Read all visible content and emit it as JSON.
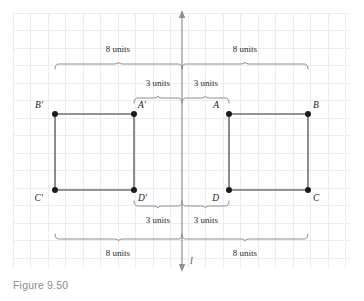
{
  "figure": {
    "caption": "Figure 9.50",
    "line_label": "l",
    "canvas": {
      "width": 364,
      "height": 301
    },
    "grid": {
      "x_start": 13,
      "x_end": 350,
      "y_start": 13,
      "y_end": 268,
      "spacing": 17.5,
      "color": "#ededf0"
    },
    "mirror_line": {
      "name": "l",
      "x": 182,
      "y_top": 16,
      "y_bottom": 266,
      "color": "#8e8e96"
    },
    "vertices": [
      {
        "id": "A",
        "label": "A",
        "x": 229,
        "y": 114,
        "label_dx": -10,
        "label_dy": -6
      },
      {
        "id": "B",
        "label": "B",
        "x": 308,
        "y": 114,
        "label_dx": 5,
        "label_dy": -6
      },
      {
        "id": "C",
        "label": "C",
        "x": 308,
        "y": 190,
        "label_dx": 5,
        "label_dy": 11
      },
      {
        "id": "D",
        "label": "D",
        "x": 229,
        "y": 190,
        "label_dx": -10,
        "label_dy": 11
      },
      {
        "id": "Ap",
        "label": "A′",
        "x": 134,
        "y": 114,
        "label_dx": 4,
        "label_dy": -6
      },
      {
        "id": "Bp",
        "label": "B′",
        "x": 55,
        "y": 114,
        "label_dx": -12,
        "label_dy": -6
      },
      {
        "id": "Cp",
        "label": "C′",
        "x": 55,
        "y": 190,
        "label_dx": -12,
        "label_dy": 11
      },
      {
        "id": "Dp",
        "label": "D′",
        "x": 134,
        "y": 190,
        "label_dx": 4,
        "label_dy": 11
      }
    ],
    "rectangles": [
      {
        "name": "rectangle-ABCD",
        "points": "229,114 308,114 308,190 229,190 229,114"
      },
      {
        "name": "rectangle-A1B1C1D1",
        "points": "134,114 55,114 55,190 134,190 134,114"
      }
    ],
    "measurements": [
      {
        "id": "top-left-8",
        "text": "8 units",
        "x1": 55,
        "x2": 182,
        "tip_y": 62,
        "label_x": 118,
        "label_y": 52,
        "direction": "up"
      },
      {
        "id": "top-right-8",
        "text": "8 units",
        "x1": 182,
        "x2": 308,
        "tip_y": 62,
        "label_x": 245,
        "label_y": 52,
        "direction": "up"
      },
      {
        "id": "top-left-3",
        "text": "3 units",
        "x1": 134,
        "x2": 182,
        "tip_y": 96,
        "label_x": 158,
        "label_y": 86,
        "direction": "up"
      },
      {
        "id": "top-right-3",
        "text": "3 units",
        "x1": 182,
        "x2": 229,
        "tip_y": 96,
        "label_x": 206,
        "label_y": 86,
        "direction": "up"
      },
      {
        "id": "bottom-left-3",
        "text": "3 units",
        "x1": 134,
        "x2": 182,
        "tip_y": 208,
        "label_x": 158,
        "label_y": 223,
        "direction": "down"
      },
      {
        "id": "bottom-right-3",
        "text": "3 units",
        "x1": 182,
        "x2": 229,
        "tip_y": 208,
        "label_x": 206,
        "label_y": 223,
        "direction": "down"
      },
      {
        "id": "bottom-left-8",
        "text": "8 units",
        "x1": 55,
        "x2": 182,
        "tip_y": 241,
        "label_x": 118,
        "label_y": 256,
        "direction": "down"
      },
      {
        "id": "bottom-right-8",
        "text": "8 units",
        "x1": 182,
        "x2": 308,
        "tip_y": 241,
        "label_x": 245,
        "label_y": 256,
        "direction": "down"
      }
    ]
  }
}
